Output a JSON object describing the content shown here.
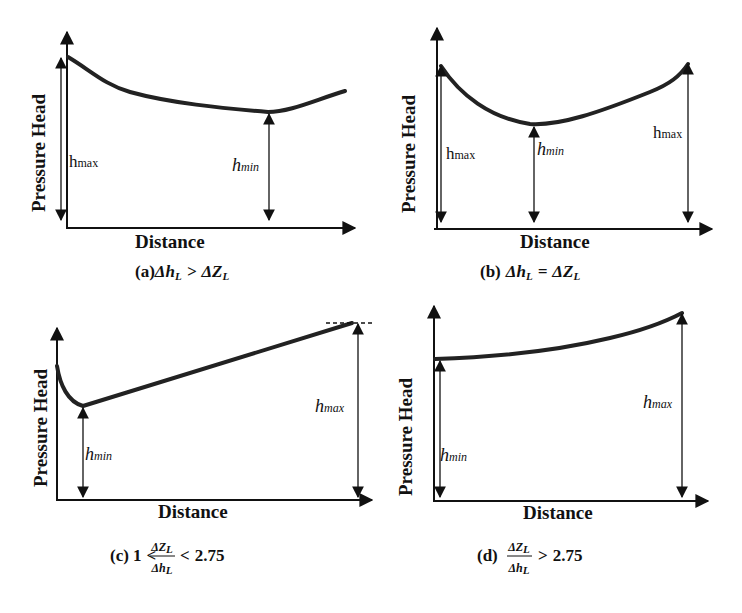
{
  "figure": {
    "panels": [
      {
        "id": "a",
        "ylabel": "Pressure Head",
        "xlabel": "Distance",
        "annotations": {
          "max": "h",
          "max_sub": "max",
          "min": "h",
          "min_sub": "min"
        },
        "caption": {
          "prefix": "(a)",
          "lhs": "Δh",
          "lhs_sub": "L",
          "op": ">",
          "rhs": "ΔZ",
          "rhs_sub": "L"
        }
      },
      {
        "id": "b",
        "ylabel": "Pressure Head",
        "xlabel": "Distance",
        "annotations": {
          "max_left": "h",
          "max_left_sub": "max",
          "min": "h",
          "min_sub": "min",
          "max_right": "h",
          "max_right_sub": "max"
        },
        "caption": {
          "prefix": "(b)",
          "lhs": "Δh",
          "lhs_sub": "L",
          "op": "=",
          "rhs": "ΔZ",
          "rhs_sub": "L"
        }
      },
      {
        "id": "c",
        "ylabel": "Pressure Head",
        "xlabel": "Distance",
        "annotations": {
          "min": "h",
          "min_sub": "min",
          "max": "h",
          "max_sub": "max"
        },
        "caption": {
          "prefix": "(c)",
          "left": "1",
          "op1": "<",
          "num": "ΔZ",
          "num_sub": "L",
          "den": "Δh",
          "den_sub": "L",
          "op2": "<",
          "right": "2.75"
        }
      },
      {
        "id": "d",
        "ylabel": "Pressure Head",
        "xlabel": "Distance",
        "annotations": {
          "min": "h",
          "min_sub": "min",
          "max": "h",
          "max_sub": "max"
        },
        "caption": {
          "prefix": "(d)",
          "num": "ΔZ",
          "num_sub": "L",
          "den": "Δh",
          "den_sub": "L",
          "op": ">",
          "right": "2.75"
        }
      }
    ]
  }
}
